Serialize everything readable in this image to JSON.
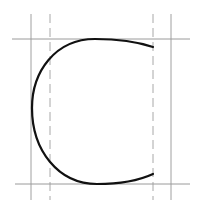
{
  "diagram": {
    "colors": {
      "background": "#ffffff",
      "guide": "#9a9a9a",
      "curve": "#111111"
    },
    "guides": {
      "vertical_solid": [
        31,
        171
      ],
      "vertical_dashed": [
        50,
        153
      ],
      "horizontal_solid": [
        39,
        184
      ]
    },
    "curve": {
      "start": [
        153,
        47
      ],
      "top_tangent": [
        95,
        39
      ],
      "leftmost": [
        32,
        108
      ],
      "bottom_tangent": [
        95,
        184
      ],
      "end": [
        153,
        174
      ]
    }
  }
}
